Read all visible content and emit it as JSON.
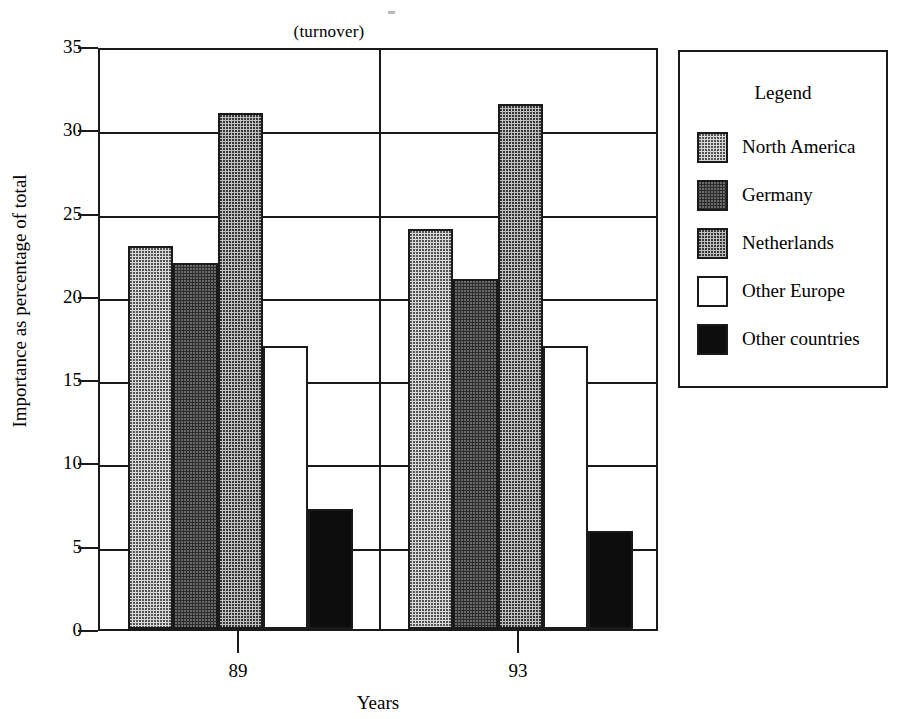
{
  "chart_data": {
    "type": "bar",
    "title": "(turnover)",
    "xlabel": "Years",
    "ylabel": "Importance as percentage of total",
    "categories": [
      "89",
      "93"
    ],
    "ylim": [
      0,
      35
    ],
    "yticks": [
      0,
      5,
      10,
      15,
      20,
      25,
      30,
      35
    ],
    "grid": true,
    "legend_position": "right",
    "legend_title": "Legend",
    "series": [
      {
        "name": "North America",
        "values": [
          23.0,
          24.0
        ],
        "pattern": "light-dots",
        "color": "#d9d9d9"
      },
      {
        "name": "Germany",
        "values": [
          22.0,
          21.0
        ],
        "pattern": "dark-dots",
        "color": "#2b2b2b"
      },
      {
        "name": "Netherlands",
        "values": [
          31.0,
          31.5
        ],
        "pattern": "medium-dots",
        "color": "#bfbfbf"
      },
      {
        "name": "Other Europe",
        "values": [
          17.0,
          17.0
        ],
        "pattern": "solid-white",
        "color": "#ffffff"
      },
      {
        "name": "Other countries",
        "values": [
          7.2,
          5.9
        ],
        "pattern": "solid-black",
        "color": "#0d0d0d"
      }
    ]
  },
  "axis": {
    "y_tick_labels": [
      "35",
      "30",
      "25",
      "20",
      "15",
      "10",
      "5",
      "0"
    ],
    "x_tick_labels": [
      "89",
      "93"
    ],
    "y_title": "Importance as percentage of total",
    "x_title": "Years"
  },
  "title": "(turnover)",
  "legend": {
    "title": "Legend",
    "items": [
      {
        "label": "North America"
      },
      {
        "label": "Germany"
      },
      {
        "label": "Netherlands"
      },
      {
        "label": "Other Europe"
      },
      {
        "label": "Other countries"
      }
    ]
  }
}
